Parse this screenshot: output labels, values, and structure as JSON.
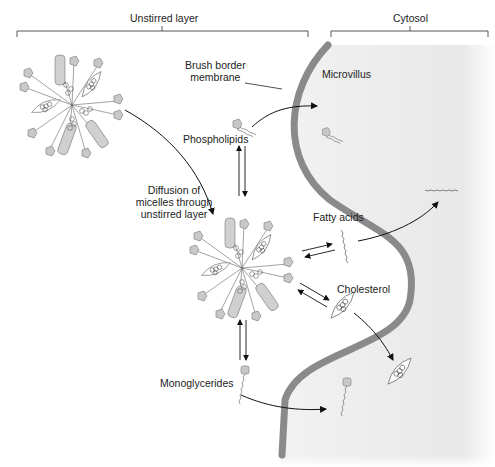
{
  "regions": {
    "unstirred_layer": "Unstirred layer",
    "cytosol": "Cytosol"
  },
  "labels": {
    "brush_border_line1": "Brush border",
    "brush_border_line2": "membrane",
    "microvillus": "Microvillus",
    "phospholipids": "Phospholipids",
    "diffusion_line1": "Diffusion of",
    "diffusion_line2": "micelles through",
    "diffusion_line3": "unstirred layer",
    "fatty_acids": "Fatty acids",
    "cholesterol": "Cholesterol",
    "monoglycerides": "Monoglycerides"
  },
  "colors": {
    "membrane": "#8a8a8a",
    "cytosol_fill": "#ececec",
    "text": "#222222",
    "arrow": "#111111",
    "micelle_head": "#c8c8c8"
  }
}
